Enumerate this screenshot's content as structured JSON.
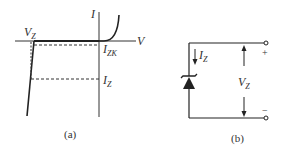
{
  "figure": {
    "stroke_color": "#222222",
    "background": "#ffffff"
  },
  "panel_a": {
    "caption": "(a)",
    "title": "Zener diode I-V characteristic",
    "axis_current_label": "I",
    "axis_voltage_label": "V",
    "vz_label": {
      "main": "V",
      "sub": "Z"
    },
    "izk_label": {
      "main": "I",
      "sub": "ZK"
    },
    "iz_label": {
      "main": "I",
      "sub": "Z"
    }
  },
  "panel_b": {
    "caption": "(b)",
    "title": "Zener diode circuit symbol with reverse current and voltage",
    "current_label": {
      "main": "I",
      "sub": "Z"
    },
    "voltage_label": {
      "main": "V",
      "sub": "Z"
    },
    "plus_sign": "+",
    "minus_sign": "−"
  }
}
